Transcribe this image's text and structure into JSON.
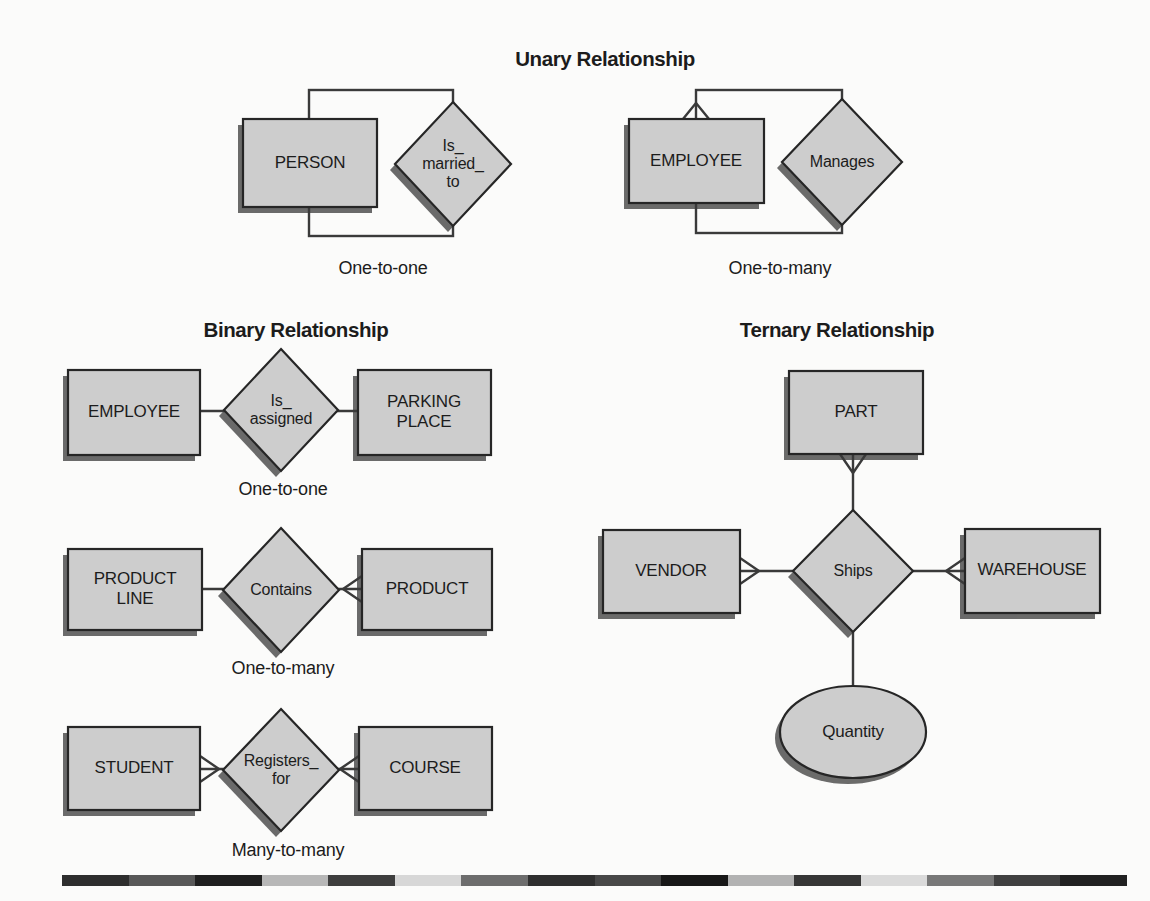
{
  "figure": {
    "background": "#fbfbfa",
    "shape_fill": "#cdcdcd",
    "shape_border": "#262626",
    "connector_color": "#3a3a3a",
    "shadow_color": "#4b4b4b"
  },
  "sections": {
    "unary": {
      "title": "Unary Relationship",
      "examples": [
        {
          "entity": "PERSON",
          "relationship": "Is_\nmarried_\nto",
          "cardinality": "One-to-one"
        },
        {
          "entity": "EMPLOYEE",
          "relationship": "Manages",
          "cardinality": "One-to-many"
        }
      ]
    },
    "binary": {
      "title": "Binary Relationship",
      "examples": [
        {
          "left_entity": "EMPLOYEE",
          "relationship": "Is_\nassigned",
          "right_entity": "PARKING\nPLACE",
          "cardinality": "One-to-one"
        },
        {
          "left_entity": "PRODUCT\nLINE",
          "relationship": "Contains",
          "right_entity": "PRODUCT",
          "cardinality": "One-to-many"
        },
        {
          "left_entity": "STUDENT",
          "relationship": "Registers_\nfor",
          "right_entity": "COURSE",
          "cardinality": "Many-to-many"
        }
      ]
    },
    "ternary": {
      "title": "Ternary Relationship",
      "top_entity": "PART",
      "left_entity": "VENDOR",
      "right_entity": "WAREHOUSE",
      "relationship": "Ships",
      "attribute": "Quantity"
    }
  },
  "decor_bar": {
    "colors": [
      "#2e2e2e",
      "#585858",
      "#1f1f1f",
      "#b7b7b7",
      "#3e3e3e",
      "#d7d7d7",
      "#6d6d6d",
      "#2f2f2f",
      "#484848",
      "#181818",
      "#b2b2b2",
      "#363636",
      "#dadada",
      "#787878",
      "#404040",
      "#212121"
    ]
  }
}
